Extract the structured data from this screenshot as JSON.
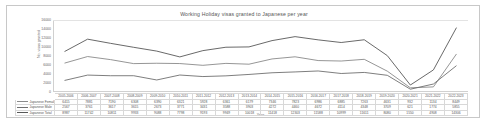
{
  "chart_data": {
    "type": "line",
    "title": "Working Holiday visas granted to Japanese per year",
    "xlabel": "Year",
    "ylabel": "No. visas granted",
    "ylim": [
      0,
      16000
    ],
    "yticks": [
      0,
      2000,
      4000,
      6000,
      8000,
      10000,
      12000,
      14000,
      16000
    ],
    "ytick_labels": [
      "0",
      "2000",
      "4000",
      "6000",
      "8000",
      "10000",
      "12000",
      "14000",
      "16000"
    ],
    "grid": false,
    "legend_position": "table-left",
    "categories": [
      "2005-2006",
      "2006-2007",
      "2007-2008",
      "2008-2009",
      "2009-2010",
      "2010-2011",
      "2011-2012",
      "2012-2013",
      "2013-2014",
      "2014-2015",
      "2015-2016",
      "2016-2017",
      "2017-2018",
      "2018-2019",
      "2019-2020",
      "2020-2021",
      "2021-2022",
      "2022-2023"
    ],
    "series": [
      {
        "name": "Japanese Female",
        "color": "#8a8a8a",
        "values": [
          6415,
          7881,
          7190,
          6308,
          6390,
          6321,
          5928,
          6361,
          6179,
          7346,
          7823,
          6986,
          6885,
          7263,
          4631,
          932,
          1134,
          8449
        ]
      },
      {
        "name": "Japanese Male",
        "color": "#6f6f6f",
        "values": [
          2567,
          3761,
          3617,
          3615,
          2673,
          3771,
          3431,
          3588,
          3903,
          4272,
          4460,
          4672,
          4114,
          4348,
          3709,
          621,
          1774,
          5855
        ]
      },
      {
        "name": "Japanese Total",
        "color": "#585858",
        "values": [
          8987,
          11742,
          10811,
          9933,
          9088,
          7798,
          9193,
          9949,
          10018,
          11418,
          12303,
          11588,
          10999,
          11611,
          8080,
          1550,
          4908,
          14306
        ]
      }
    ]
  },
  "table": {
    "row_labels": [
      "Japanese Female",
      "Japanese Male",
      "Japanese Total"
    ]
  }
}
